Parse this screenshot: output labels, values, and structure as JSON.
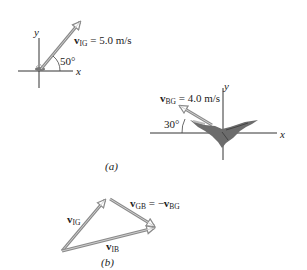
{
  "figure_a": {
    "caption": "(a)",
    "left_diagram": {
      "y_axis_label": "y",
      "x_axis_label": "x",
      "vector_label_main": "v",
      "vector_label_sub": "IG",
      "vector_value": "= 5.0 m/s",
      "angle_label": "50°",
      "angle_deg": 50,
      "arrow_color": "#9a9a9a"
    },
    "right_diagram": {
      "y_axis_label": "y",
      "x_axis_label": "x",
      "vector_label_main": "v",
      "vector_label_sub": "BG",
      "vector_value": "= 4.0 m/s",
      "angle_label": "30°",
      "angle_deg": 30,
      "subject": "bat"
    }
  },
  "figure_b": {
    "caption": "(b)",
    "vectors": [
      {
        "main": "v",
        "sub": "IG"
      },
      {
        "main": "v",
        "sub": "GB",
        "eq": "= −",
        "main2": "v",
        "sub2": "BG"
      },
      {
        "main": "v",
        "sub": "IB"
      }
    ]
  }
}
